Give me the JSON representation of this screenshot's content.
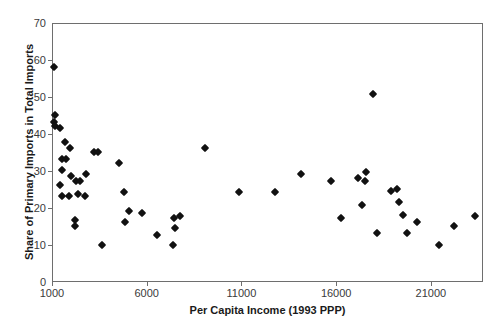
{
  "chart_data": {
    "type": "scatter",
    "title": "",
    "xlabel": "Per Capita Income (1993 PPP)",
    "ylabel": "Share of Primary Imports in Total Imports",
    "xlim": [
      1000,
      23750
    ],
    "ylim": [
      0,
      70
    ],
    "xticks": [
      1000,
      6000,
      11000,
      16000,
      21000
    ],
    "xtick_labels": [
      "1000",
      "6000",
      "11000",
      "16000",
      "21000"
    ],
    "yticks": [
      0,
      10,
      20,
      30,
      40,
      50,
      60,
      70
    ],
    "ytick_labels": [
      "0",
      "10",
      "20",
      "30",
      "40",
      "50",
      "60",
      "70"
    ],
    "grid": false,
    "legend": false,
    "marker": "diamond",
    "marker_color": "#111111",
    "frame_color": "#6e6e6e",
    "background": "#ffffff",
    "series": [
      {
        "name": "Countries",
        "points": [
          {
            "x": 1050,
            "y": 58.5
          },
          {
            "x": 1100,
            "y": 45.5
          },
          {
            "x": 1050,
            "y": 43.5
          },
          {
            "x": 1080,
            "y": 42.5
          },
          {
            "x": 1350,
            "y": 42.0
          },
          {
            "x": 1650,
            "y": 38.0
          },
          {
            "x": 1900,
            "y": 36.5
          },
          {
            "x": 1500,
            "y": 33.5
          },
          {
            "x": 1700,
            "y": 33.5
          },
          {
            "x": 1450,
            "y": 30.5
          },
          {
            "x": 1380,
            "y": 26.5
          },
          {
            "x": 1500,
            "y": 23.5
          },
          {
            "x": 1820,
            "y": 23.5
          },
          {
            "x": 1950,
            "y": 29.0
          },
          {
            "x": 2200,
            "y": 27.5
          },
          {
            "x": 2400,
            "y": 27.5
          },
          {
            "x": 2750,
            "y": 29.5
          },
          {
            "x": 2300,
            "y": 24.0
          },
          {
            "x": 2700,
            "y": 23.5
          },
          {
            "x": 3150,
            "y": 35.5
          },
          {
            "x": 3400,
            "y": 35.5
          },
          {
            "x": 2150,
            "y": 17.0
          },
          {
            "x": 2150,
            "y": 15.5
          },
          {
            "x": 3600,
            "y": 10.3
          },
          {
            "x": 4500,
            "y": 32.5
          },
          {
            "x": 4750,
            "y": 24.5
          },
          {
            "x": 5000,
            "y": 19.5
          },
          {
            "x": 4800,
            "y": 16.5
          },
          {
            "x": 5700,
            "y": 19.0
          },
          {
            "x": 6500,
            "y": 13.0
          },
          {
            "x": 7400,
            "y": 17.5
          },
          {
            "x": 7700,
            "y": 18.0
          },
          {
            "x": 7450,
            "y": 15.0
          },
          {
            "x": 7350,
            "y": 10.3
          },
          {
            "x": 9000,
            "y": 36.5
          },
          {
            "x": 10800,
            "y": 24.5
          },
          {
            "x": 12700,
            "y": 24.5
          },
          {
            "x": 14100,
            "y": 29.5
          },
          {
            "x": 15700,
            "y": 27.5
          },
          {
            "x": 16200,
            "y": 17.5
          },
          {
            "x": 17100,
            "y": 28.5
          },
          {
            "x": 17500,
            "y": 30.0
          },
          {
            "x": 17450,
            "y": 27.5
          },
          {
            "x": 17300,
            "y": 21.0
          },
          {
            "x": 17900,
            "y": 51.0
          },
          {
            "x": 18100,
            "y": 13.5
          },
          {
            "x": 18850,
            "y": 25.0
          },
          {
            "x": 19150,
            "y": 25.5
          },
          {
            "x": 19250,
            "y": 22.0
          },
          {
            "x": 19450,
            "y": 18.5
          },
          {
            "x": 19700,
            "y": 13.5
          },
          {
            "x": 20200,
            "y": 16.5
          },
          {
            "x": 21400,
            "y": 10.3
          },
          {
            "x": 22150,
            "y": 15.5
          },
          {
            "x": 23250,
            "y": 18.0
          }
        ]
      }
    ]
  }
}
